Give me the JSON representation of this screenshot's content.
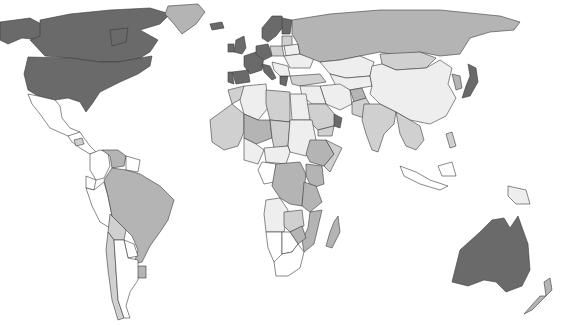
{
  "map": {
    "type": "choropleth",
    "projection": "world",
    "legend": null,
    "classes": [
      {
        "id": "c0",
        "label": "class 0 (lowest)",
        "color": "#ffffff"
      },
      {
        "id": "c1",
        "label": "class 1",
        "color": "#eeeeee"
      },
      {
        "id": "c2",
        "label": "class 2",
        "color": "#d0d0d0"
      },
      {
        "id": "c3",
        "label": "class 3",
        "color": "#b4b4b4"
      },
      {
        "id": "c4",
        "label": "class 4 (highest)",
        "color": "#6a6a6a"
      }
    ],
    "regions": [
      {
        "name": "Canada",
        "class": "c4"
      },
      {
        "name": "United States",
        "class": "c4"
      },
      {
        "name": "Alaska",
        "class": "c4"
      },
      {
        "name": "Greenland",
        "class": "c3"
      },
      {
        "name": "Mexico",
        "class": "c0"
      },
      {
        "name": "Central America",
        "class": "c0"
      },
      {
        "name": "Honduras",
        "class": "c2"
      },
      {
        "name": "Colombia",
        "class": "c0"
      },
      {
        "name": "Venezuela",
        "class": "c3"
      },
      {
        "name": "Guyana/Suriname",
        "class": "c0"
      },
      {
        "name": "Ecuador",
        "class": "c0"
      },
      {
        "name": "Peru",
        "class": "c0"
      },
      {
        "name": "Brazil",
        "class": "c3"
      },
      {
        "name": "Bolivia",
        "class": "c2"
      },
      {
        "name": "Paraguay",
        "class": "c0"
      },
      {
        "name": "Uruguay",
        "class": "c3"
      },
      {
        "name": "Chile",
        "class": "c2"
      },
      {
        "name": "Argentina",
        "class": "c0"
      },
      {
        "name": "Iceland",
        "class": "c4"
      },
      {
        "name": "United Kingdom",
        "class": "c4"
      },
      {
        "name": "Ireland",
        "class": "c4"
      },
      {
        "name": "Scandinavia",
        "class": "c4"
      },
      {
        "name": "Finland",
        "class": "c4"
      },
      {
        "name": "France",
        "class": "c4"
      },
      {
        "name": "Germany",
        "class": "c4"
      },
      {
        "name": "Spain",
        "class": "c4"
      },
      {
        "name": "Portugal",
        "class": "c4"
      },
      {
        "name": "Italy",
        "class": "c4"
      },
      {
        "name": "Greece",
        "class": "c4"
      },
      {
        "name": "Poland",
        "class": "c2"
      },
      {
        "name": "Baltic States",
        "class": "c2"
      },
      {
        "name": "Belarus",
        "class": "c1"
      },
      {
        "name": "Ukraine",
        "class": "c1"
      },
      {
        "name": "Balkans",
        "class": "c1"
      },
      {
        "name": "Turkey",
        "class": "c2"
      },
      {
        "name": "Russia",
        "class": "c3"
      },
      {
        "name": "Kazakhstan",
        "class": "c1"
      },
      {
        "name": "Central Asia",
        "class": "c1"
      },
      {
        "name": "Mongolia",
        "class": "c2"
      },
      {
        "name": "China",
        "class": "c1"
      },
      {
        "name": "Korea",
        "class": "c3"
      },
      {
        "name": "Japan",
        "class": "c4"
      },
      {
        "name": "Iran",
        "class": "c1"
      },
      {
        "name": "Afghanistan",
        "class": "c3"
      },
      {
        "name": "Pakistan",
        "class": "c2"
      },
      {
        "name": "India",
        "class": "c2"
      },
      {
        "name": "Saudi Arabia",
        "class": "c2"
      },
      {
        "name": "Oman/UAE",
        "class": "c4"
      },
      {
        "name": "Yemen",
        "class": "c2"
      },
      {
        "name": "Iraq/Syria",
        "class": "c1"
      },
      {
        "name": "Southeast Asia",
        "class": "c2"
      },
      {
        "name": "Indonesia",
        "class": "c0"
      },
      {
        "name": "Papua New Guinea",
        "class": "c1"
      },
      {
        "name": "Philippines",
        "class": "c2"
      },
      {
        "name": "Australia",
        "class": "c4"
      },
      {
        "name": "New Zealand",
        "class": "c3"
      },
      {
        "name": "Morocco",
        "class": "c2"
      },
      {
        "name": "Algeria",
        "class": "c1"
      },
      {
        "name": "Libya",
        "class": "c2"
      },
      {
        "name": "Egypt",
        "class": "c1"
      },
      {
        "name": "West Africa",
        "class": "c2"
      },
      {
        "name": "Mali/Niger",
        "class": "c3"
      },
      {
        "name": "Chad",
        "class": "c2"
      },
      {
        "name": "Sudan",
        "class": "c1"
      },
      {
        "name": "Ethiopia",
        "class": "c3"
      },
      {
        "name": "Somalia",
        "class": "c2"
      },
      {
        "name": "Nigeria",
        "class": "c1"
      },
      {
        "name": "Central Africa",
        "class": "c1"
      },
      {
        "name": "Gabon/Congo",
        "class": "c0"
      },
      {
        "name": "DR Congo",
        "class": "c3"
      },
      {
        "name": "Kenya",
        "class": "c3"
      },
      {
        "name": "Tanzania",
        "class": "c3"
      },
      {
        "name": "Angola",
        "class": "c1"
      },
      {
        "name": "Zambia",
        "class": "c2"
      },
      {
        "name": "Mozambique",
        "class": "c3"
      },
      {
        "name": "Zimbabwe",
        "class": "c3"
      },
      {
        "name": "Namibia",
        "class": "c0"
      },
      {
        "name": "Botswana",
        "class": "c0"
      },
      {
        "name": "South Africa",
        "class": "c0"
      },
      {
        "name": "Madagascar",
        "class": "c3"
      }
    ]
  }
}
